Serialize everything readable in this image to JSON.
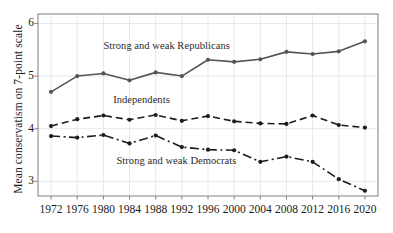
{
  "chart_data": {
    "type": "line",
    "title": "",
    "subtitle": "",
    "xlabel": "",
    "ylabel": "Mean conservatism on 7-point scale",
    "categories": [
      "1972",
      "1976",
      "1980",
      "1984",
      "1988",
      "1992",
      "1996",
      "2000",
      "2004",
      "2008",
      "2012",
      "2016",
      "2020"
    ],
    "x": [
      1972,
      1976,
      1980,
      1984,
      1988,
      1992,
      1996,
      2000,
      2004,
      2008,
      2012,
      2016,
      2020
    ],
    "xlim": [
      1970,
      2022
    ],
    "ylim": [
      2.72,
      6.18
    ],
    "yticks": [
      3,
      4,
      5,
      6
    ],
    "ytick_labels": [
      "3",
      "4",
      "5",
      "6"
    ],
    "grid": true,
    "legend_position": "inline-annotations",
    "series": [
      {
        "name": "Strong and weak Republicans",
        "style": "solid",
        "color": "#555555",
        "marker": "circle",
        "values": [
          4.7,
          5.0,
          5.05,
          4.92,
          5.07,
          5.0,
          5.31,
          5.27,
          5.32,
          5.46,
          5.42,
          5.47,
          5.66
        ]
      },
      {
        "name": "Independents",
        "style": "dashed",
        "color": "#1d1d1d",
        "marker": "circle",
        "values": [
          4.05,
          4.18,
          4.25,
          4.17,
          4.26,
          4.15,
          4.24,
          4.14,
          4.1,
          4.09,
          4.25,
          4.07,
          4.02
        ]
      },
      {
        "name": "Strong and weak Democrats",
        "style": "dashdot",
        "color": "#1d1d1d",
        "marker": "circle",
        "values": [
          3.86,
          3.83,
          3.88,
          3.72,
          3.87,
          3.65,
          3.6,
          3.59,
          3.37,
          3.47,
          3.37,
          3.04,
          2.82
        ]
      }
    ],
    "annotations": [
      {
        "text": "Strong and weak Republicans",
        "x": 1980.0,
        "y": 5.55
      },
      {
        "text": "Independents",
        "x": 1981.5,
        "y": 4.52
      },
      {
        "text": "Strong and weak Democrats",
        "x": 1982.0,
        "y": 3.37
      }
    ]
  },
  "axis": {
    "ylabel": "Mean conservatism on 7-point scale"
  },
  "colors": {
    "republican_line": "#555555",
    "independent_line": "#1d1d1d",
    "democrat_line": "#1d1d1d",
    "axis": "#8a8a8a",
    "grid": "#e8e8e8",
    "text": "#1a1a1a",
    "background": "#ffffff"
  }
}
